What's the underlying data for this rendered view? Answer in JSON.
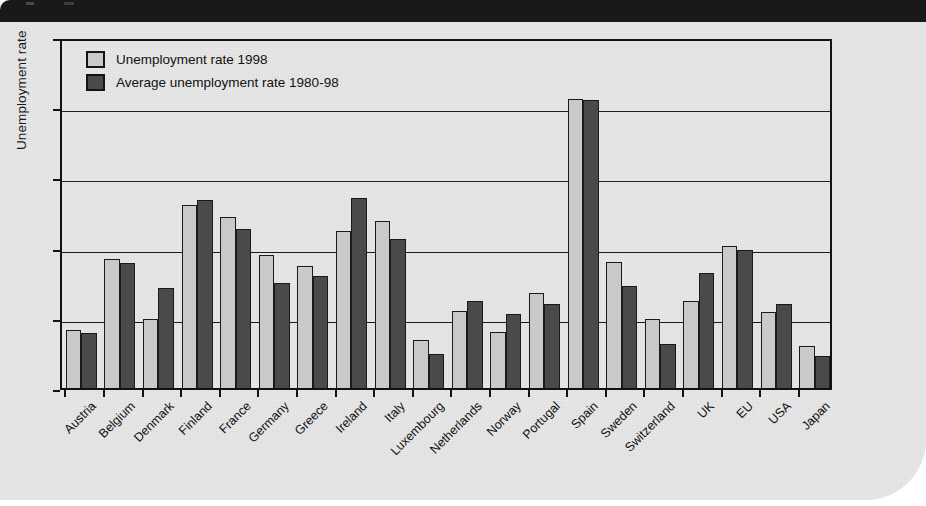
{
  "page": {
    "background_color": "#e9e9e9",
    "top_band_color": "#191919"
  },
  "chart_data": {
    "type": "bar",
    "title": "",
    "xlabel": "",
    "ylabel": "Unemployment rate",
    "ylim": [
      0,
      25
    ],
    "yticks": [
      0,
      5,
      10,
      15,
      20,
      25
    ],
    "grid": true,
    "legend_position": "top-left-inside",
    "colors": {
      "series1": "#c9c9c9",
      "series2": "#4a4a4a"
    },
    "categories": [
      "Austria",
      "Belgium",
      "Denmark",
      "Finland",
      "France",
      "Germany",
      "Greece",
      "Ireland",
      "Italy",
      "Luxembourg",
      "Netherlands",
      "Norway",
      "Portugal",
      "Spain",
      "Sweden",
      "Switzerland",
      "UK",
      "EU",
      "USA",
      "Japan"
    ],
    "series": [
      {
        "name": "Unemployment rate 1998",
        "values": [
          4.1,
          9.2,
          4.9,
          13.0,
          12.2,
          9.5,
          8.7,
          11.2,
          11.9,
          3.4,
          5.5,
          4.0,
          6.8,
          20.6,
          9.0,
          4.9,
          6.2,
          10.1,
          5.4,
          3.0
        ]
      },
      {
        "name": "Average unemployment rate 1980-98",
        "values": [
          3.9,
          8.9,
          7.1,
          13.4,
          11.3,
          7.5,
          8.0,
          13.5,
          10.6,
          2.4,
          6.2,
          5.3,
          6.0,
          20.5,
          7.3,
          3.1,
          8.2,
          9.8,
          6.0,
          2.3
        ]
      }
    ]
  }
}
